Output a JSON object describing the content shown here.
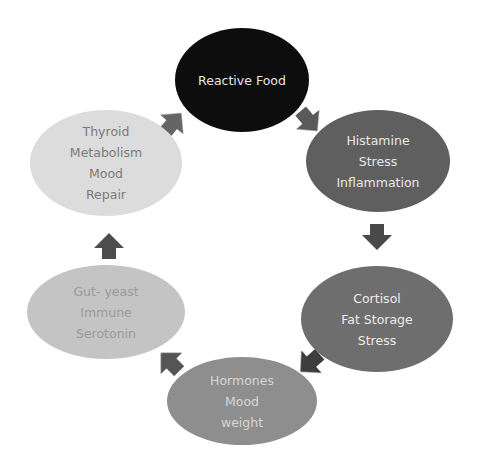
{
  "diagram": {
    "type": "cycle",
    "nodes": [
      {
        "id": "reactive-food",
        "lines": [
          "Reactive  Food"
        ],
        "fill": "#0b0b0b",
        "text_color": "#e6e6e6"
      },
      {
        "id": "histamine",
        "lines": [
          "Histamine",
          "Stress",
          "Inflammation"
        ],
        "fill": "#5e5e5e",
        "text_color": "#e8e8e8"
      },
      {
        "id": "cortisol",
        "lines": [
          "Cortisol",
          "Fat Storage",
          "Stress"
        ],
        "fill": "#6e6e6e",
        "text_color": "#ececec"
      },
      {
        "id": "hormones",
        "lines": [
          "Hormones",
          "Mood",
          "weight"
        ],
        "fill": "#8e8e8e",
        "text_color": "#d6d6d6"
      },
      {
        "id": "gut",
        "lines": [
          "Gut- yeast",
          "Immune",
          "Serotonin"
        ],
        "fill": "#c4c4c4",
        "text_color": "#9a9a9a"
      },
      {
        "id": "thyroid",
        "lines": [
          "Thyroid",
          "Metabolism",
          "Mood",
          "Repair"
        ],
        "fill": "#dcdcdc",
        "text_color": "#7a7a7a"
      }
    ],
    "edges": [
      {
        "from": "reactive-food",
        "to": "histamine",
        "color": "#5a5a5a"
      },
      {
        "from": "histamine",
        "to": "cortisol",
        "color": "#4a4a4a"
      },
      {
        "from": "cortisol",
        "to": "hormones",
        "color": "#3c3c3c"
      },
      {
        "from": "hormones",
        "to": "gut",
        "color": "#555555"
      },
      {
        "from": "gut",
        "to": "thyroid",
        "color": "#4e4e4e"
      },
      {
        "from": "thyroid",
        "to": "reactive-food",
        "color": "#656565"
      }
    ]
  }
}
